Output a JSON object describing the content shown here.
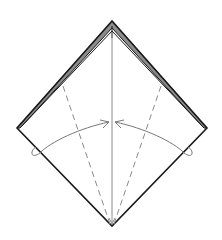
{
  "diagram": {
    "type": "origami-fold-instruction",
    "colors": {
      "background": "#ffffff",
      "edge": "#1a1a1a",
      "layer_fill": "#9a9a9a",
      "center_line": "#8a8a8a",
      "valley_fold": "#8a8a8a",
      "arrow": "#777777"
    },
    "shape": {
      "top": [
        112,
        21
      ],
      "left": [
        17,
        128
      ],
      "right": [
        207,
        128
      ],
      "bottom": [
        112,
        226
      ]
    },
    "folds": [
      {
        "name": "left-valley-fold",
        "style": "dashed",
        "from": [
          63,
          85
        ],
        "to": [
          110,
          224
        ]
      },
      {
        "name": "right-valley-fold",
        "style": "dashed",
        "from": [
          161,
          85
        ],
        "to": [
          114,
          224
        ]
      },
      {
        "name": "center-line",
        "style": "solid",
        "from": [
          112,
          38
        ],
        "to": [
          112,
          224
        ]
      }
    ],
    "arrows": [
      {
        "name": "left-fold-arrow",
        "direction": "fold-to-center",
        "from_side": "left"
      },
      {
        "name": "right-fold-arrow",
        "direction": "fold-to-center",
        "from_side": "right"
      }
    ]
  }
}
